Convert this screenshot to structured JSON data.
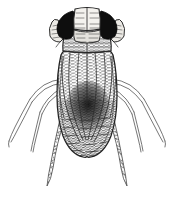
{
  "figure": {
    "title": "Insect dorsal view engraving",
    "medium": "pen-and-ink hatched engraving",
    "orientation": "dorsal",
    "background_color": "#ffffff",
    "ink_color": "#2b2b2b",
    "shade_color": "#3a3a3a",
    "canvas": {
      "width": 174,
      "height": 200
    }
  },
  "subject": {
    "common_description": "leafhopper-like insect seen from above",
    "symmetry": "bilateral, vertical axis at x = 87"
  },
  "parts": {
    "head": {
      "label": "head",
      "vertex_label": "pale vertex",
      "vertex_fill": "#f2f0ec",
      "top_y": 8,
      "bottom_y": 34,
      "width": 34
    },
    "eyes": {
      "label": "compound eyes",
      "count": 2,
      "fill": "#111111",
      "left_center_x": 67,
      "right_center_x": 107,
      "center_y": 24
    },
    "tubercles": {
      "label": "lateral pale lobes",
      "count": 2,
      "fill": "#e9e7e2",
      "left_center_x": 56,
      "right_center_x": 118
    },
    "pronotum": {
      "label": "pronotum",
      "top_y": 30,
      "bottom_y": 52,
      "left_x": 62,
      "right_x": 112
    },
    "wings": {
      "label": "forewings",
      "count": 2,
      "top_y": 50,
      "bottom_y": 155,
      "vein_count": 5,
      "shading": "dense longitudinal hatching"
    },
    "abdomen_tip": {
      "label": "abdomen tip",
      "y": 156,
      "shape": "rounded"
    },
    "dark_patch": {
      "label": "central dark patch",
      "center_x": 88,
      "center_y": 107,
      "fill": "#1c1c1c"
    },
    "legs": [
      {
        "name": "left-foreleg",
        "side": "left",
        "pair": "fore",
        "style": "thin double line",
        "from": [
          62,
          80
        ],
        "to": [
          9,
          141
        ]
      },
      {
        "name": "right-foreleg",
        "side": "right",
        "pair": "fore",
        "style": "thin double line",
        "from": [
          112,
          80
        ],
        "to": [
          165,
          141
        ]
      },
      {
        "name": "left-midleg",
        "side": "left",
        "pair": "mid",
        "style": "thin double line",
        "from": [
          62,
          90
        ],
        "to": [
          31,
          150
        ]
      },
      {
        "name": "right-midleg",
        "side": "right",
        "pair": "mid",
        "style": "thin double line",
        "from": [
          112,
          90
        ],
        "to": [
          143,
          150
        ]
      },
      {
        "name": "left-hindleg",
        "side": "left",
        "pair": "hind",
        "style": "hatched tapering femur",
        "from": [
          60,
          118
        ],
        "to": [
          48,
          186
        ]
      },
      {
        "name": "right-hindleg",
        "side": "right",
        "pair": "hind",
        "style": "hatched tapering femur",
        "from": [
          114,
          118
        ],
        "to": [
          126,
          186
        ]
      }
    ]
  }
}
